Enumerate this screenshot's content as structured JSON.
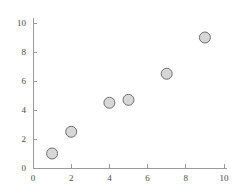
{
  "chart_data": {
    "type": "scatter",
    "title": "",
    "subtitle": "",
    "xlabel": "",
    "ylabel": "",
    "xlim": [
      0,
      10
    ],
    "ylim": [
      0,
      10
    ],
    "xticks": [
      0,
      2,
      4,
      6,
      8,
      10
    ],
    "yticks": [
      0,
      2,
      4,
      6,
      8,
      10
    ],
    "xtick_labels": [
      "0",
      "2",
      "4",
      "6",
      "8",
      "10"
    ],
    "ytick_labels": [
      "0",
      "2",
      "4",
      "6",
      "8",
      "10"
    ],
    "grid": false,
    "legend": null,
    "annotations": [],
    "series": [
      {
        "name": "",
        "marker": "circle",
        "marker_fill": "#d7d7d7",
        "marker_edge": "#6e6e6e",
        "points": [
          {
            "x": 1,
            "y": 1.0
          },
          {
            "x": 2,
            "y": 2.5
          },
          {
            "x": 4,
            "y": 4.5
          },
          {
            "x": 5,
            "y": 4.7
          },
          {
            "x": 7,
            "y": 6.5
          },
          {
            "x": 9,
            "y": 9.0
          }
        ]
      }
    ]
  },
  "style": {
    "background": "#ffffff",
    "axis_color": "#9a9a9a",
    "tick_label_color": "#4a4a4a"
  }
}
